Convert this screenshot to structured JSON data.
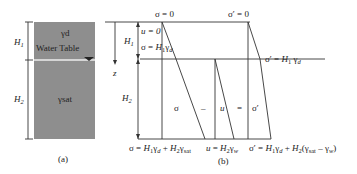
{
  "figure": {
    "panel_a": {
      "caption": "(a)",
      "upper_layer_label": "γd",
      "water_table_label": "Water Table",
      "lower_layer_label": "γsat",
      "dim_upper": "H1",
      "dim_lower": "H2",
      "soil_color": "#8e8e8e",
      "water_line_color": "#e8e8e8"
    },
    "panel_b": {
      "caption": "(b)",
      "top_sigma": "σ = 0",
      "top_sigma_prime": "σ′ = 0",
      "u_zero": "u = 0",
      "sigma_at_wt": "σ = H1γd",
      "sigma_prime_at_wt": "σ′ = H1 γd",
      "dim_upper": "H1",
      "dim_lower": "H2",
      "depth_axis": "z",
      "equation": {
        "sigma": "σ",
        "minus": "–",
        "u": "u",
        "equals": "=",
        "sigma_prime": "σ′"
      },
      "bottom_sigma": "σ = H1γd + H2γsat",
      "bottom_u": "u = H2γw",
      "bottom_sigma_prime": "σ′ = H1γd + H2(γsat – γw)"
    }
  }
}
